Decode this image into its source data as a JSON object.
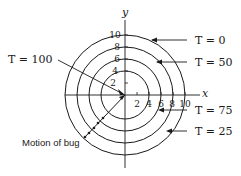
{
  "diagram": {
    "axes": {
      "x_label": "x",
      "y_label": "y"
    },
    "x_ticks": [
      "2",
      "4",
      "6",
      "8",
      "10"
    ],
    "y_ticks": [
      "2",
      "4",
      "6",
      "8",
      "10"
    ],
    "circles": [
      {
        "radius": 4
      },
      {
        "radius": 6
      },
      {
        "radius": 8
      },
      {
        "radius": 10
      }
    ],
    "labels": {
      "t100": "T = 100",
      "t0": "T = 0",
      "t50": "T = 50",
      "t75": "T = 75",
      "t25": "T = 25",
      "motion": "Motion of bug"
    },
    "colors": {
      "ink": "#1a1a1a",
      "background": "#ffffff"
    }
  }
}
